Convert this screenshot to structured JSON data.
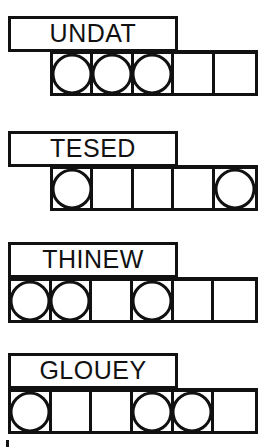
{
  "sheet": {
    "title": "Word Scramble Answer Grid",
    "ink_color": "#111111",
    "paper_color": "#ffffff",
    "puzzle_count": 4
  },
  "puzzles": [
    {
      "id": "puzzle-1",
      "word": "UNDAT",
      "word_box": {
        "left": 8,
        "top": 16,
        "width": 170,
        "height": 36
      },
      "grid": {
        "left": 50,
        "top": 50,
        "width": 208,
        "height": 46,
        "cells": 5
      },
      "circles": [
        true,
        true,
        true,
        false,
        false
      ],
      "circle_positions": [
        1,
        2,
        3
      ]
    },
    {
      "id": "puzzle-2",
      "word": "TESED",
      "word_box": {
        "left": 8,
        "top": 131,
        "width": 170,
        "height": 36
      },
      "grid": {
        "left": 50,
        "top": 165,
        "width": 208,
        "height": 46,
        "cells": 5
      },
      "circles": [
        true,
        false,
        false,
        false,
        true
      ],
      "circle_positions": [
        1,
        5
      ]
    },
    {
      "id": "puzzle-3",
      "word": "THINEW",
      "word_box": {
        "left": 8,
        "top": 242,
        "width": 170,
        "height": 36
      },
      "grid": {
        "left": 8,
        "top": 277,
        "width": 250,
        "height": 46,
        "cells": 6
      },
      "circles": [
        true,
        true,
        false,
        true,
        false,
        false
      ],
      "circle_positions": [
        1,
        2,
        4
      ]
    },
    {
      "id": "puzzle-4",
      "word": "GLOUEY",
      "word_box": {
        "left": 8,
        "top": 353,
        "width": 170,
        "height": 36
      },
      "grid": {
        "left": 8,
        "top": 388,
        "width": 250,
        "height": 46,
        "cells": 6
      },
      "circles": [
        true,
        false,
        false,
        true,
        true,
        false
      ],
      "circle_positions": [
        1,
        4,
        5
      ]
    }
  ],
  "margin_mark": {
    "left": 6,
    "top": 440,
    "width": 3,
    "height": 7
  }
}
